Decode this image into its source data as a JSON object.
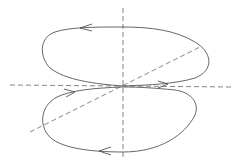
{
  "diagram": {
    "type": "phase-portrait",
    "colors": {
      "background": "#ffffff",
      "curve": "#555555",
      "axes": "#666666"
    },
    "axes": [
      {
        "name": "horizontal-axis",
        "style": "dashed"
      },
      {
        "name": "vertical-axis",
        "style": "dashed"
      },
      {
        "name": "diagonal-axis",
        "style": "dashed"
      }
    ],
    "loops": [
      {
        "name": "upper-loop",
        "arrows": [
          "left (top)",
          "right (bottom near origin)"
        ]
      },
      {
        "name": "lower-loop",
        "arrows": [
          "right (top near origin)",
          "left (bottom)"
        ]
      }
    ]
  }
}
